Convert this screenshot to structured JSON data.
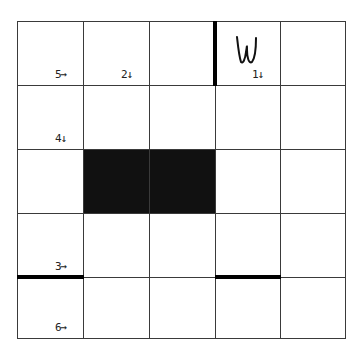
{
  "puzzle": {
    "rows": 5,
    "cols": 5,
    "col_edges": [
      0,
      66,
      132,
      198,
      263,
      328
    ],
    "row_edges": [
      0,
      64,
      128,
      192,
      256,
      317
    ],
    "blocks": [
      {
        "row": 2,
        "col": 1
      },
      {
        "row": 2,
        "col": 2
      }
    ],
    "clues": [
      {
        "row": 0,
        "col": 0,
        "text": "5→"
      },
      {
        "row": 0,
        "col": 1,
        "text": "2↓"
      },
      {
        "row": 0,
        "col": 3,
        "text": "1↓"
      },
      {
        "row": 1,
        "col": 0,
        "text": "4↓"
      },
      {
        "row": 3,
        "col": 0,
        "text": "3→"
      },
      {
        "row": 4,
        "col": 0,
        "text": "6→"
      }
    ],
    "walls": [
      {
        "type": "vertical",
        "x_edge": 3,
        "row": 0
      },
      {
        "type": "horizontal",
        "y_edge": 4,
        "col": 0
      },
      {
        "type": "horizontal",
        "y_edge": 4,
        "col": 3
      }
    ],
    "marks": [
      {
        "row": 0,
        "col": 3,
        "symbol": "W",
        "kind": "handwritten-letter"
      }
    ],
    "colors": {
      "grid": "#3a3a3a",
      "block": "#111111",
      "wall": "#000000",
      "background": "#ffffff"
    }
  }
}
